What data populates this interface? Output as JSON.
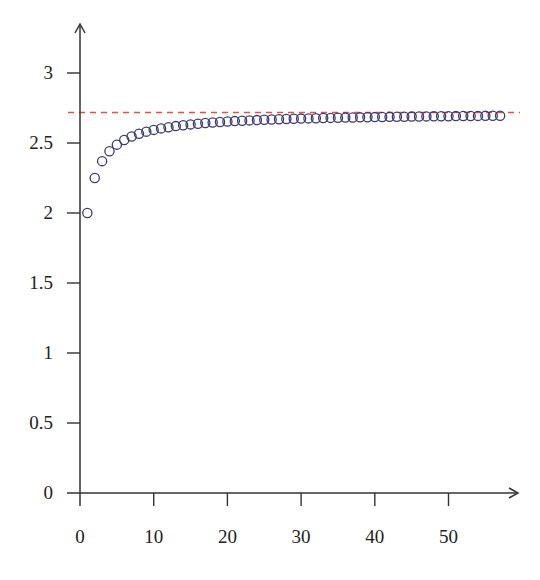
{
  "chart_data": {
    "type": "scatter",
    "title": "",
    "xlabel": "",
    "ylabel": "",
    "x_ticks": [
      0,
      10,
      20,
      30,
      40,
      50
    ],
    "y_ticks": [
      0,
      0.5,
      1,
      1.5,
      2,
      2.5,
      3
    ],
    "y_tick_labels": [
      "0",
      "0.5",
      "1",
      "1.5",
      "2",
      "2.5",
      "3"
    ],
    "x_tick_labels": [
      "0",
      "10",
      "20",
      "30",
      "40",
      "50"
    ],
    "xlim": [
      0,
      57
    ],
    "ylim": [
      0,
      3.3
    ],
    "grid": false,
    "legend": null,
    "series": [
      {
        "name": "(1+1/n)^n",
        "marker": "open-circle",
        "color": "#3a3a7a",
        "n_start": 1,
        "n_end": 57,
        "sample_values": {
          "1": 2.0,
          "2": 2.25,
          "3": 2.37,
          "4": 2.441,
          "5": 2.488,
          "10": 2.594,
          "20": 2.653,
          "30": 2.674,
          "40": 2.685,
          "50": 2.692,
          "57": 2.695
        }
      }
    ],
    "reference_lines": [
      {
        "name": "e",
        "y": 2.718,
        "style": "dashed",
        "color": "#e8503a"
      }
    ]
  },
  "colors": {
    "axis": "#333333",
    "marker": "#3a3a7a",
    "asymptote": "#e8503a"
  }
}
